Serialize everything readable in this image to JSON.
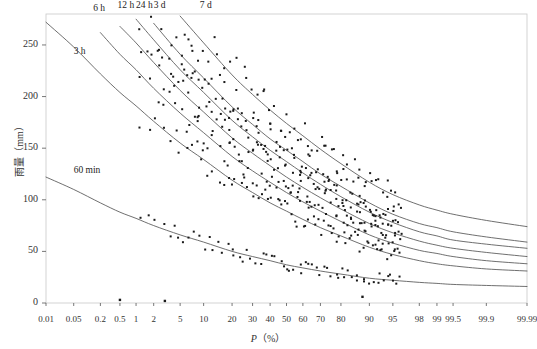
{
  "chart_data": {
    "type": "line",
    "title": "",
    "subtitle": "",
    "xlabel": "P(%)",
    "ylabel": "雨量（mm）",
    "ylabel_unit": "mm",
    "grid": false,
    "legend_position": "inline-curve-labels",
    "x_scale": "probability",
    "xlim": [
      0.01,
      99.99
    ],
    "ylim": [
      0,
      280
    ],
    "x_tick_labels": [
      "0.01",
      "0.05",
      "0.2",
      "0.5",
      "1",
      "2",
      "5",
      "10",
      "20",
      "30",
      "40",
      "50",
      "60",
      "70",
      "80",
      "90",
      "95",
      "98",
      "99",
      "99.5",
      "99.9",
      "99.99"
    ],
    "x_tick_values": [
      0.01,
      0.05,
      0.2,
      0.5,
      1,
      2,
      5,
      10,
      20,
      30,
      40,
      50,
      60,
      70,
      80,
      90,
      95,
      98,
      99,
      99.5,
      99.9,
      99.99
    ],
    "y_tick_labels": [
      "0",
      "50",
      "100",
      "150",
      "200",
      "250"
    ],
    "y_tick_values": [
      0,
      50,
      100,
      150,
      200,
      250
    ],
    "series": [
      {
        "name": "60 min",
        "label": "60 min",
        "label_x_pct": 0.05,
        "label_y_mm": 128,
        "color": "#555555",
        "x": [
          0.01,
          0.05,
          0.2,
          0.5,
          1,
          2,
          5,
          10,
          20,
          30,
          40,
          50,
          60,
          70,
          80,
          90,
          95,
          98,
          99,
          99.5,
          99.9,
          99.99
        ],
        "values": [
          122,
          110,
          97,
          88,
          82,
          75,
          66,
          59,
          50,
          45,
          41,
          37,
          34,
          31,
          28,
          24,
          22,
          20,
          19,
          18,
          17,
          16
        ]
      },
      {
        "name": "3 h",
        "label": "3 h",
        "label_x_pct": 0.05,
        "label_y_mm": 243,
        "color": "#555555",
        "x": [
          0.01,
          0.05,
          0.2,
          0.5,
          1,
          2,
          5,
          10,
          20,
          30,
          40,
          50,
          60,
          70,
          80,
          90,
          95,
          98,
          99,
          99.5,
          99.9,
          99.99
        ],
        "values": [
          272,
          248,
          222,
          204,
          191,
          176,
          155,
          139,
          119,
          107,
          97,
          89,
          81,
          73,
          65,
          54,
          47,
          41,
          38,
          36,
          33,
          31
        ]
      },
      {
        "name": "6 h",
        "label": "6 h",
        "label_x_pct": 0.14,
        "label_y_mm": 285,
        "color": "#555555",
        "x": [
          0.05,
          0.2,
          0.5,
          1,
          2,
          5,
          10,
          20,
          30,
          40,
          50,
          60,
          70,
          80,
          90,
          95,
          98,
          99,
          99.5,
          99.9,
          99.99
        ],
        "values": [
          292,
          262,
          241,
          226,
          208,
          184,
          165,
          142,
          128,
          117,
          107,
          98,
          89,
          79,
          66,
          58,
          51,
          48,
          45,
          41,
          38
        ]
      },
      {
        "name": "12 h",
        "label": "12 h",
        "label_x_pct": 0.45,
        "label_y_mm": 288,
        "color": "#555555",
        "x": [
          0.2,
          0.5,
          1,
          2,
          5,
          10,
          20,
          30,
          40,
          50,
          60,
          70,
          80,
          90,
          95,
          98,
          99,
          99.5,
          99.9,
          99.99
        ],
        "values": [
          291,
          268,
          252,
          233,
          206,
          185,
          160,
          145,
          133,
          122,
          112,
          102,
          91,
          77,
          68,
          60,
          56,
          53,
          49,
          45
        ]
      },
      {
        "name": "24 h",
        "label": "24 h",
        "label_x_pct": 1.0,
        "label_y_mm": 288,
        "color": "#555555",
        "x": [
          0.5,
          1,
          2,
          5,
          10,
          20,
          30,
          40,
          50,
          60,
          70,
          80,
          90,
          95,
          98,
          99,
          99.5,
          99.9,
          99.99
        ],
        "values": [
          292,
          275,
          255,
          226,
          204,
          177,
          161,
          148,
          137,
          126,
          115,
          103,
          88,
          78,
          69,
          65,
          61,
          57,
          53
        ]
      },
      {
        "name": "3 d",
        "label": "3 d",
        "label_x_pct": 2.0,
        "label_y_mm": 288,
        "color": "#555555",
        "x": [
          1,
          2,
          5,
          10,
          20,
          30,
          40,
          50,
          60,
          70,
          80,
          90,
          95,
          98,
          99,
          99.5,
          99.9,
          99.99
        ],
        "values": [
          291,
          271,
          241,
          218,
          190,
          173,
          159,
          148,
          137,
          125,
          113,
          97,
          86,
          77,
          73,
          69,
          64,
          59
        ]
      },
      {
        "name": "7 d",
        "label": "7 d",
        "label_x_pct": 9.0,
        "label_y_mm": 288,
        "color": "#555555",
        "x": [
          3.5,
          5,
          10,
          20,
          30,
          40,
          50,
          60,
          70,
          80,
          90,
          95,
          98,
          99,
          99.5,
          99.9,
          99.99
        ],
        "values": [
          291,
          278,
          252,
          221,
          202,
          187,
          174,
          162,
          149,
          135,
          117,
          105,
          95,
          90,
          86,
          80,
          74
        ]
      }
    ],
    "scatter": {
      "marker": "square",
      "marker_size_px": 2,
      "color": "#1a1a1a",
      "note": "observed annual maxima plotted along each duration curve",
      "outliers": [
        {
          "x": 0.5,
          "y": 3
        },
        {
          "x": 3.0,
          "y": 2
        },
        {
          "x": 88,
          "y": 6
        }
      ]
    }
  }
}
